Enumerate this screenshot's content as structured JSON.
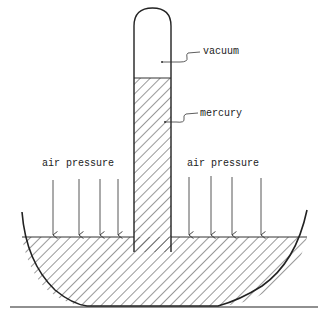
{
  "diagram": {
    "labels": {
      "vacuum": "vacuum",
      "mercury": "mercury",
      "air_pressure_left": "air pressure",
      "air_pressure_right": "air pressure"
    },
    "colors": {
      "ink": "#222222",
      "background": "#ffffff"
    },
    "arrows": {
      "left_count": 4,
      "right_count": 4
    }
  }
}
